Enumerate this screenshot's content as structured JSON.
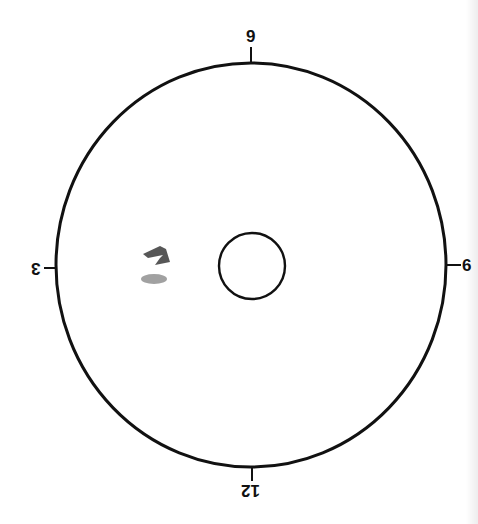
{
  "diagram": {
    "type": "clock-dial",
    "orientation_note": "rotated 180 degrees",
    "labels": {
      "top": "9",
      "left": "3",
      "right": "6",
      "bottom": "12"
    },
    "outer_circle": {
      "cx": 251,
      "cy": 265,
      "rx": 195,
      "ry": 202,
      "stroke": "#111111"
    },
    "inner_circle": {
      "cx": 252,
      "cy": 266,
      "r": 33,
      "stroke": "#111111"
    },
    "marks": [
      {
        "name": "pencil-mark-upper",
        "color": "#444444"
      },
      {
        "name": "pencil-smudge-lower",
        "color": "#8a8a8a"
      }
    ]
  }
}
